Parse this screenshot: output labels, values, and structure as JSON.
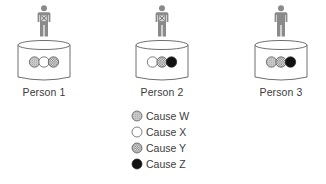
{
  "diagram": {
    "people": [
      {
        "label": "Person 1",
        "marked": true,
        "causes": [
          "W",
          "X",
          "Y"
        ]
      },
      {
        "label": "Person 2",
        "marked": true,
        "causes": [
          "X",
          "Y",
          "Z"
        ]
      },
      {
        "label": "Person 3",
        "marked": false,
        "causes": [
          "W",
          "Y",
          "Z"
        ]
      }
    ],
    "legend": [
      {
        "key": "W",
        "label": "Cause W",
        "style": "light-gray-fill"
      },
      {
        "key": "X",
        "label": "Cause X",
        "style": "white-fill"
      },
      {
        "key": "Y",
        "label": "Cause Y",
        "style": "crosshatch"
      },
      {
        "key": "Z",
        "label": "Cause Z",
        "style": "black-fill"
      }
    ],
    "colors": {
      "figure": "#8a8a8a",
      "outline": "#4a4a4a",
      "cause_w": "#c8c8c8",
      "cause_x": "#ffffff",
      "cause_y": "#9a9a9a",
      "cause_z": "#111111"
    }
  }
}
